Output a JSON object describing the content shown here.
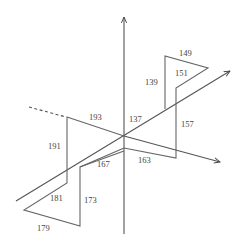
{
  "diagram": {
    "type": "3d-axis-step-path",
    "colors": {
      "background": "#ffffff",
      "line": "#666666",
      "axis": "#555555",
      "text": "#444444"
    },
    "labels": {
      "l137": "137",
      "l139": "139",
      "l149": "149",
      "l151": "151",
      "l157": "157",
      "l163": "163",
      "l167": "167",
      "l173": "173",
      "l179": "179",
      "l181": "181",
      "l191": "191",
      "l193": "193"
    }
  }
}
